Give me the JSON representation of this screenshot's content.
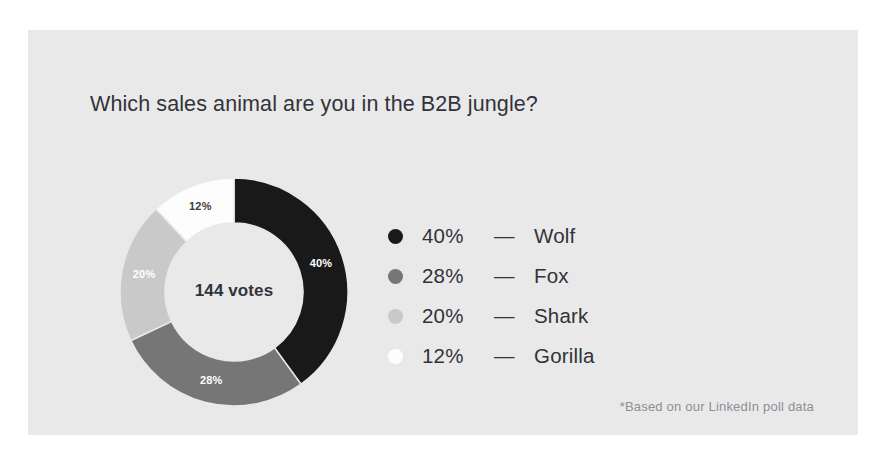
{
  "card": {
    "background": "#e9e9e9",
    "page_background": "#ffffff"
  },
  "title": "Which sales animal are you in the B2B jungle?",
  "footnote": "*Based on our LinkedIn poll data",
  "center_label": "144 votes",
  "legend": {
    "dash": "—",
    "rows": [
      {
        "percent": "40%",
        "name": "Wolf",
        "color": "#191919"
      },
      {
        "percent": "28%",
        "name": "Fox",
        "color": "#767676"
      },
      {
        "percent": "20%",
        "name": "Shark",
        "color": "#c9c9c9"
      },
      {
        "percent": "12%",
        "name": "Gorilla",
        "color": "#fdfdfd"
      }
    ]
  },
  "chart_data": {
    "type": "pie",
    "variant": "donut",
    "title": "Which sales animal are you in the B2B jungle?",
    "center_text": "144 votes",
    "total_votes": 144,
    "unit": "%",
    "start_angle_deg": 0,
    "direction": "clockwise",
    "hole_ratio": 0.605,
    "outer_radius": 114,
    "inner_radius": 69,
    "categories": [
      "Wolf",
      "Fox",
      "Shark",
      "Gorilla"
    ],
    "values": [
      40,
      28,
      20,
      12
    ],
    "colors": [
      "#191919",
      "#767676",
      "#c9c9c9",
      "#fdfdfd"
    ],
    "slice_labels": [
      "40%",
      "28%",
      "20%",
      "12%"
    ],
    "slice_label_colors": [
      "#ffffff",
      "#ffffff",
      "#ffffff",
      "#3b3d42"
    ],
    "legend_position": "right",
    "grid": false
  }
}
